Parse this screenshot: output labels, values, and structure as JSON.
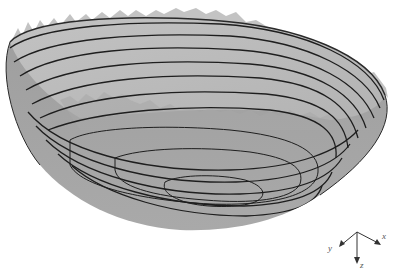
{
  "figure": {
    "surface_color": "#b4b4b4",
    "inner_surface_color": "#bdbdbd",
    "outer_surface_color": "#a5a5a5",
    "contour_color": "#1e1e1e",
    "contour_count": 11
  },
  "axes": {
    "x_label": "x",
    "y_label": "y",
    "z_label": "z",
    "arrow_color": "#333333"
  }
}
